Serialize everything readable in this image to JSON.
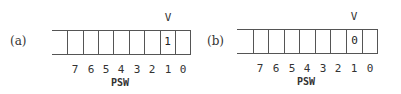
{
  "panels": [
    {
      "label": "(a)",
      "flag_name": "V",
      "flag_bit_value": "1",
      "register_name": "PSW",
      "bit_numbers": [
        "7",
        "6",
        "5",
        "4",
        "3",
        "2",
        "1",
        "0"
      ]
    },
    {
      "label": "(b)",
      "flag_name": "V",
      "flag_bit_value": "0",
      "register_name": "PSW",
      "bit_numbers": [
        "7",
        "6",
        "5",
        "4",
        "3",
        "2",
        "1",
        "0"
      ]
    }
  ]
}
